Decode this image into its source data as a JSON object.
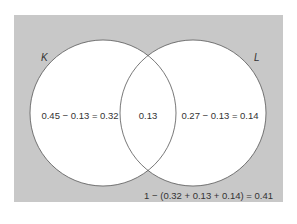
{
  "diagram": {
    "type": "venn",
    "colors": {
      "universe_fill": "#c8c8c8",
      "circle_fill": "#ffffff",
      "circle_stroke": "#555555",
      "text": "#333333"
    },
    "sets": [
      {
        "name": "K",
        "label": "K"
      },
      {
        "name": "L",
        "label": "L"
      }
    ],
    "regions": {
      "k_only": "0.45 − 0.13 = 0.32",
      "intersection": "0.13",
      "l_only": "0.27 − 0.13 = 0.14",
      "outside": "1 − (0.32 + 0.13 + 0.14) = 0.41"
    }
  }
}
